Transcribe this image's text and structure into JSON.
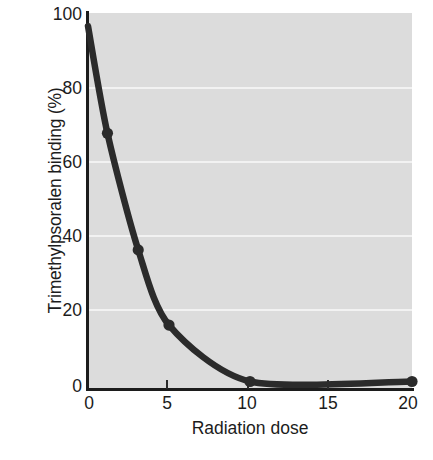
{
  "chart_data": {
    "type": "line",
    "title": "",
    "xlabel": "Radiation dose",
    "ylabel": "Trimethylpsoralen binding (%)",
    "xlim": [
      0,
      20
    ],
    "ylim": [
      0,
      100
    ],
    "xticks": [
      "0",
      "5",
      "10",
      "15",
      "20"
    ],
    "xtick_values": [
      0,
      5,
      10,
      15,
      20
    ],
    "yticks": [
      "0",
      "20",
      "40",
      "60",
      "80",
      "100"
    ],
    "ytick_values": [
      0,
      20,
      40,
      60,
      80,
      100
    ],
    "grid": "horizontal-white-gridlines",
    "legend": "none",
    "plot_background_color": "#dcdcdc",
    "series_color": "#2b2b2b",
    "marker": "filled-circle",
    "series": [
      {
        "name": "Trimethylpsoralen binding",
        "x": [
          0,
          1.2,
          3.1,
          5.0,
          10,
          20
        ],
        "values": [
          96.5,
          68,
          37,
          17,
          2,
          2
        ]
      }
    ]
  },
  "axes": {
    "y_title": "Trimethylpsoralen binding (%)",
    "x_title": "Radiation dose",
    "y_tick_labels": [
      "100",
      "80",
      "60",
      "40",
      "20",
      "0"
    ],
    "x_tick_labels": [
      "0",
      "5",
      "10",
      "15",
      "20"
    ]
  }
}
